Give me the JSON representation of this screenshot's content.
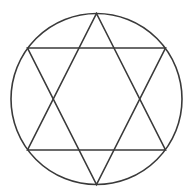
{
  "figure": {
    "background": "#ffffff",
    "stroke_color": "#3a3a3a",
    "stroke_width": 1.6,
    "circle": {
      "cx": 96.5,
      "cy": 99,
      "r": 85.5
    },
    "triangles": [
      {
        "name": "upward-triangle",
        "points": [
          [
            96.5,
            13.5
          ],
          [
            165.5,
            150
          ],
          [
            27.5,
            150
          ]
        ]
      },
      {
        "name": "downward-triangle",
        "points": [
          [
            27.5,
            48
          ],
          [
            165.5,
            48
          ],
          [
            96.5,
            184.5
          ]
        ]
      }
    ]
  }
}
